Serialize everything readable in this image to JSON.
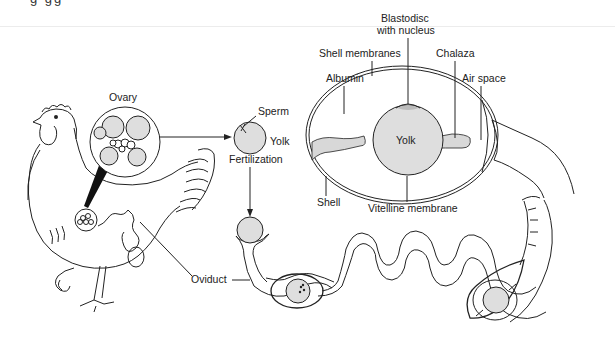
{
  "figure": {
    "top_fragment": "g       gg"
  },
  "labels": {
    "ovary": "Ovary",
    "sperm": "Sperm",
    "yolk_small": "Yolk",
    "fertilization": "Fertilization",
    "oviduct": "Oviduct",
    "blastodisc_line1": "Blastodisc",
    "blastodisc_line2": "with nucleus",
    "shell_membranes": "Shell membranes",
    "chalaza": "Chalaza",
    "albumin": "Albumin",
    "air_space": "Air space",
    "yolk_egg": "Yolk",
    "shell": "Shell",
    "vitelline_membrane": "Vitelline membrane"
  },
  "colors": {
    "line": "#222222",
    "yolk_fill": "#dedede",
    "background": "#ffffff"
  }
}
